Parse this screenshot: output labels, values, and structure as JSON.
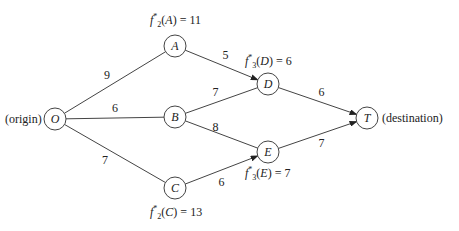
{
  "diagram": {
    "type": "shortest-path network",
    "nodes": [
      {
        "id": "O",
        "x": 55,
        "y": 119,
        "note": "(origin)"
      },
      {
        "id": "A",
        "x": 175,
        "y": 46
      },
      {
        "id": "B",
        "x": 175,
        "y": 117
      },
      {
        "id": "C",
        "x": 175,
        "y": 188
      },
      {
        "id": "D",
        "x": 268,
        "y": 84
      },
      {
        "id": "E",
        "x": 268,
        "y": 152
      },
      {
        "id": "T",
        "x": 367,
        "y": 118,
        "note": "(destination)"
      }
    ],
    "edges": [
      {
        "from": "O",
        "to": "A",
        "weight": "9",
        "arrow": false
      },
      {
        "from": "O",
        "to": "B",
        "weight": "6",
        "arrow": false
      },
      {
        "from": "O",
        "to": "C",
        "weight": "7",
        "arrow": false
      },
      {
        "from": "A",
        "to": "D",
        "weight": "5",
        "arrow": true
      },
      {
        "from": "B",
        "to": "D",
        "weight": "7",
        "arrow": false
      },
      {
        "from": "B",
        "to": "E",
        "weight": "8",
        "arrow": false
      },
      {
        "from": "C",
        "to": "E",
        "weight": "6",
        "arrow": true
      },
      {
        "from": "D",
        "to": "T",
        "weight": "6",
        "arrow": true
      },
      {
        "from": "E",
        "to": "T",
        "weight": "7",
        "arrow": true
      }
    ],
    "origin_label": "(origin)",
    "destination_label": "(destination)",
    "annotations": {
      "A": {
        "stage": "2",
        "node": "A",
        "value": "11"
      },
      "C": {
        "stage": "2",
        "node": "C",
        "value": "13"
      },
      "D": {
        "stage": "3",
        "node": "D",
        "value": "6"
      },
      "E": {
        "stage": "3",
        "node": "E",
        "value": "7"
      }
    }
  }
}
